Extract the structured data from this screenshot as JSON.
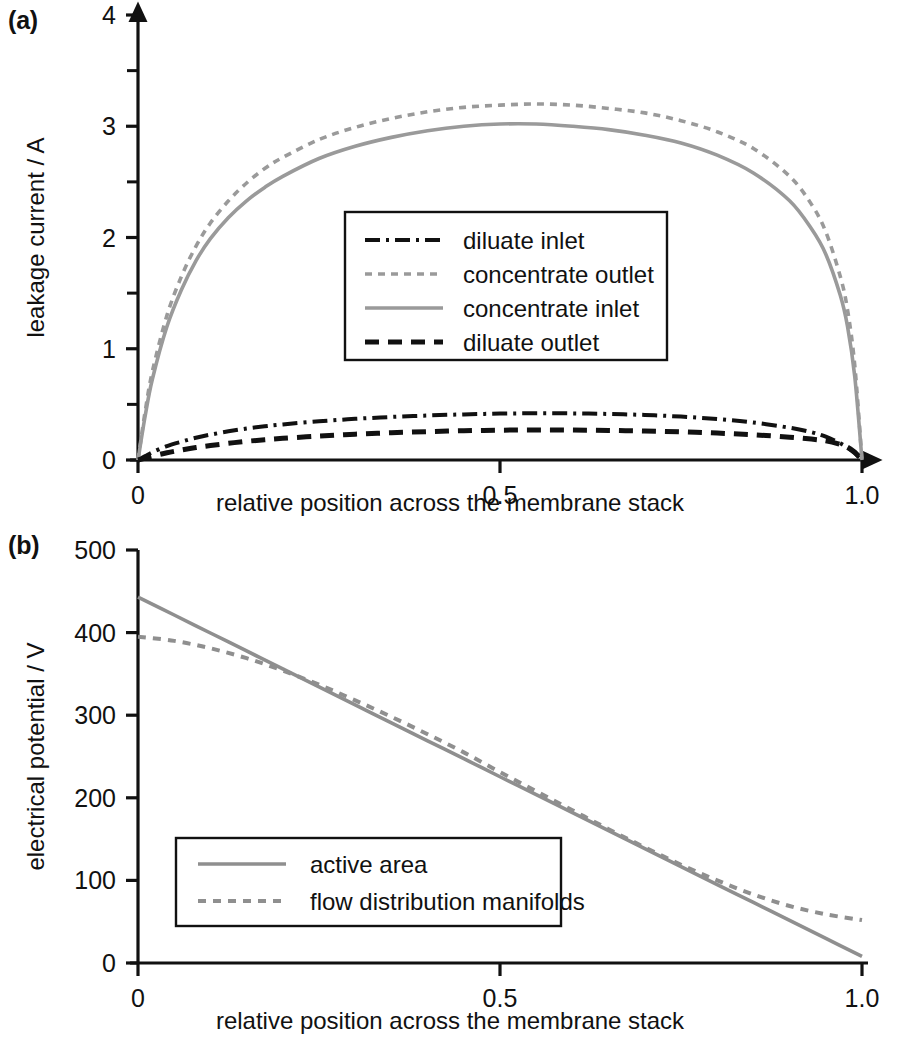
{
  "figure": {
    "panel_a_tag": "(a)",
    "panel_b_tag": "(b)"
  },
  "chart_data": [
    {
      "id": "panel-a",
      "type": "line",
      "title": "",
      "xlabel": "relative position across the membrane stack",
      "ylabel": "leakage current / A",
      "xlim": [
        0,
        1
      ],
      "ylim": [
        0,
        4
      ],
      "xticks": [
        0,
        0.5,
        1.0
      ],
      "xticklabels": [
        "0",
        "0.5",
        "1.0"
      ],
      "yticks": [
        0,
        1,
        2,
        3,
        4
      ],
      "yticklabels": [
        "0",
        "1",
        "2",
        "3",
        "4"
      ],
      "yminorticks": [
        0.5,
        1.5,
        2.5,
        3.5
      ],
      "grid": false,
      "legend_position": "center",
      "x": [
        0,
        0.01,
        0.02,
        0.04,
        0.06,
        0.08,
        0.1,
        0.125,
        0.15,
        0.175,
        0.2,
        0.25,
        0.3,
        0.35,
        0.4,
        0.45,
        0.5,
        0.55,
        0.6,
        0.65,
        0.7,
        0.75,
        0.8,
        0.85,
        0.9,
        0.93,
        0.95,
        0.97,
        0.98,
        0.99,
        1.0
      ],
      "series": [
        {
          "name": "diluate inlet",
          "style": "dashdot",
          "color": "#111111",
          "width": 4.0,
          "dasharray": "15,6,3,6",
          "values": [
            0,
            0.035,
            0.07,
            0.125,
            0.165,
            0.2,
            0.228,
            0.258,
            0.283,
            0.303,
            0.32,
            0.348,
            0.37,
            0.387,
            0.4,
            0.41,
            0.417,
            0.42,
            0.419,
            0.414,
            0.405,
            0.39,
            0.368,
            0.337,
            0.29,
            0.25,
            0.21,
            0.15,
            0.11,
            0.06,
            0
          ]
        },
        {
          "name": "concentrate outlet",
          "style": "dotted",
          "color": "#9a9a9a",
          "width": 3.6,
          "dasharray": "7,6",
          "values": [
            0,
            0.44,
            0.8,
            1.3,
            1.65,
            1.92,
            2.13,
            2.33,
            2.49,
            2.62,
            2.72,
            2.88,
            2.99,
            3.07,
            3.13,
            3.17,
            3.19,
            3.2,
            3.19,
            3.16,
            3.12,
            3.05,
            2.95,
            2.8,
            2.55,
            2.3,
            2.05,
            1.65,
            1.35,
            0.85,
            0
          ]
        },
        {
          "name": "concentrate inlet",
          "style": "solid",
          "color": "#9a9a9a",
          "width": 3.6,
          "dasharray": "none",
          "values": [
            0,
            0.4,
            0.73,
            1.2,
            1.53,
            1.79,
            1.99,
            2.18,
            2.33,
            2.45,
            2.55,
            2.71,
            2.82,
            2.9,
            2.96,
            3.0,
            3.02,
            3.02,
            3.0,
            2.97,
            2.92,
            2.85,
            2.74,
            2.58,
            2.33,
            2.08,
            1.85,
            1.48,
            1.2,
            0.75,
            0
          ]
        },
        {
          "name": "diluate outlet",
          "style": "dashed",
          "color": "#111111",
          "width": 5.0,
          "dasharray": "14,9",
          "values": [
            0,
            0.018,
            0.035,
            0.065,
            0.09,
            0.112,
            0.13,
            0.15,
            0.168,
            0.182,
            0.195,
            0.215,
            0.232,
            0.245,
            0.255,
            0.263,
            0.268,
            0.27,
            0.269,
            0.266,
            0.261,
            0.253,
            0.242,
            0.227,
            0.205,
            0.188,
            0.172,
            0.14,
            0.115,
            0.07,
            0
          ]
        }
      ]
    },
    {
      "id": "panel-b",
      "type": "line",
      "title": "",
      "xlabel": "relative position across the membrane stack",
      "ylabel": "electrical potential / V",
      "xlim": [
        0,
        1
      ],
      "ylim": [
        0,
        500
      ],
      "xticks": [
        0,
        0.5,
        1.0
      ],
      "xticklabels": [
        "0",
        "0.5",
        "1.0"
      ],
      "yticks": [
        0,
        100,
        200,
        300,
        400,
        500
      ],
      "yticklabels": [
        "0",
        "100",
        "200",
        "300",
        "400",
        "500"
      ],
      "yminorticks": [],
      "grid": false,
      "legend_position": "lower-left",
      "x": [
        0,
        0.05,
        0.1,
        0.15,
        0.2,
        0.25,
        0.3,
        0.35,
        0.4,
        0.45,
        0.5,
        0.55,
        0.6,
        0.65,
        0.7,
        0.75,
        0.8,
        0.85,
        0.9,
        0.95,
        1.0
      ],
      "series": [
        {
          "name": "active area",
          "style": "solid",
          "color": "#8f8f8f",
          "width": 3.6,
          "dasharray": "none",
          "values": [
            443,
            421.3,
            399.5,
            377.8,
            356,
            334.3,
            312.5,
            290.8,
            269,
            247.3,
            225.5,
            203.8,
            182,
            160.3,
            138.5,
            116.8,
            95,
            73.3,
            51.5,
            29.8,
            8
          ]
        },
        {
          "name": "flow distribution manifolds",
          "style": "dotted",
          "color": "#8f8f8f",
          "width": 4.0,
          "dasharray": "8,7",
          "values": [
            395,
            390,
            381,
            369,
            354,
            337,
            318,
            298,
            277,
            255,
            231,
            208,
            185,
            162,
            140,
            119,
            100,
            83,
            69,
            59,
            52
          ]
        }
      ]
    }
  ]
}
